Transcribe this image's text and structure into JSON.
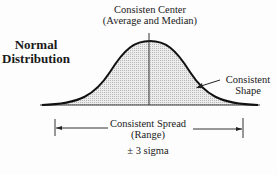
{
  "title_line1": "Normal",
  "title_line2": "Distribution",
  "center": {
    "line1": "Consisten Center",
    "line2": "(Average and Median)"
  },
  "shape": {
    "line1": "Consistent",
    "line2": "Shape"
  },
  "spread": {
    "line1": "Consistent Spread",
    "line2": "(Range)"
  },
  "sigma": "± 3 sigma",
  "colors": {
    "ink": "#1a1a1a",
    "fill": "#d9d9d9"
  }
}
